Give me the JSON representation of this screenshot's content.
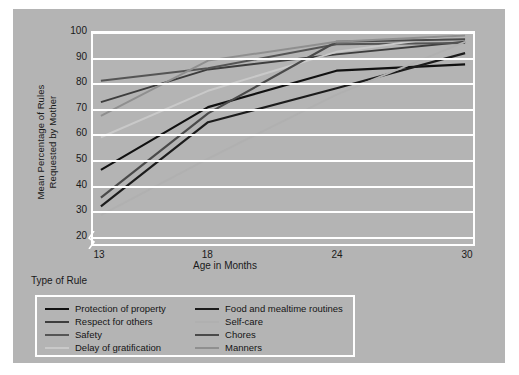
{
  "figure": {
    "background_color": "#b4b4b4",
    "plot_background_color": "#b4b4b4",
    "grid_color": "#ffffff",
    "legend_title": "Type of Rule"
  },
  "chart_data": {
    "type": "line",
    "title": "",
    "xlabel": "Age in Months",
    "ylabel": "Mean Percentage of Rules Requested by Mother",
    "ylabel_line1": "Mean Percentage of Rules",
    "ylabel_line2": "Requested by Mother",
    "x": [
      13,
      18,
      24,
      30
    ],
    "xticks": [
      "13",
      "18",
      "24",
      "30"
    ],
    "yticks": [
      "20",
      "30",
      "40",
      "50",
      "60",
      "70",
      "80",
      "90",
      "100"
    ],
    "ylim": [
      16,
      100
    ],
    "xlim": [
      13,
      30
    ],
    "axis_break": true,
    "grid": true,
    "legend_position": "below-left",
    "series": [
      {
        "name": "Protection of property",
        "color": "#111111",
        "width": 2.2,
        "values": [
          45.5,
          70.5,
          85.0,
          87.5
        ]
      },
      {
        "name": "Respect for others",
        "color": "#3d3d3d",
        "width": 2.0,
        "values": [
          72.5,
          85.5,
          91.5,
          96.5
        ]
      },
      {
        "name": "Safety",
        "color": "#555555",
        "width": 2.0,
        "values": [
          81.0,
          86.0,
          95.5,
          96.0
        ]
      },
      {
        "name": "Delay of gratification",
        "color": "#c9c9c9",
        "width": 2.0,
        "values": [
          58.5,
          77.0,
          92.5,
          99.5
        ]
      },
      {
        "name": "Food and mealtime routines",
        "color": "#1c1c1c",
        "width": 2.2,
        "values": [
          31.0,
          64.5,
          78.0,
          92.0
        ]
      },
      {
        "name": "Self-care",
        "color": "#b0b0b0",
        "width": 2.0,
        "values": [
          27.5,
          50.0,
          75.5,
          96.5
        ]
      },
      {
        "name": "Chores",
        "color": "#4a4a4a",
        "width": 2.2,
        "values": [
          34.5,
          68.0,
          96.5,
          97.5
        ]
      },
      {
        "name": "Manners",
        "color": "#8f8f8f",
        "width": 2.0,
        "values": [
          67.0,
          89.0,
          96.5,
          99.0
        ]
      }
    ]
  }
}
